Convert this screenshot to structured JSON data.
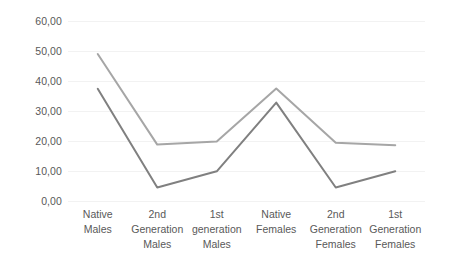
{
  "chart_data": {
    "type": "line",
    "title": "",
    "xlabel": "",
    "ylabel": "",
    "categories": [
      "Native Males",
      "2nd\nGeneration\nMales",
      "1st\ngeneration\nMales",
      "Native\nFemales",
      "2nd\nGeneration\nFemales",
      "1st\nGeneration\nFemales"
    ],
    "ylim": [
      0,
      60
    ],
    "ytick_labels": [
      "0,00",
      "10,00",
      "20,00",
      "30,00",
      "40,00",
      "50,00",
      "60,00"
    ],
    "ytick_values": [
      0,
      10,
      20,
      30,
      40,
      50,
      60
    ],
    "grid": true,
    "legend": "none",
    "series": [
      {
        "name": "series-1",
        "color": "#808080",
        "values": [
          37.4,
          4.5,
          9.9,
          32.8,
          4.5,
          9.9
        ]
      },
      {
        "name": "series-2",
        "color": "#a6a6a6",
        "values": [
          49.0,
          18.8,
          19.8,
          37.5,
          19.4,
          18.6
        ]
      }
    ]
  }
}
